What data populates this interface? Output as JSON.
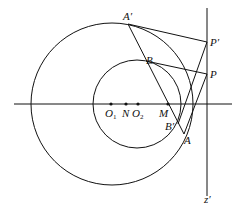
{
  "diagram": {
    "labels": {
      "A_prime": "A′",
      "P_prime": "P′",
      "B": "B",
      "P": "P",
      "O1": "O",
      "O1_sub": "1",
      "N": "N",
      "O2": "O",
      "O2_sub": "2",
      "M": "M",
      "B_prime": "B′",
      "A": "A",
      "z_prime": "z′"
    },
    "circles": [
      {
        "name": "large-circle",
        "cx": 112,
        "cy": 104,
        "r": 81
      },
      {
        "name": "small-circle",
        "cx": 137,
        "cy": 104,
        "r": 44
      }
    ],
    "points": {
      "O1": [
        111,
        104
      ],
      "N": [
        126,
        104
      ],
      "O2": [
        138,
        104
      ],
      "M": [
        168,
        104
      ],
      "A_prime": [
        128,
        24
      ],
      "P_prime": [
        207,
        42
      ],
      "B": [
        146,
        61
      ],
      "P": [
        207,
        74
      ],
      "A": [
        184,
        134
      ],
      "B_prime": [
        178,
        124
      ]
    }
  }
}
